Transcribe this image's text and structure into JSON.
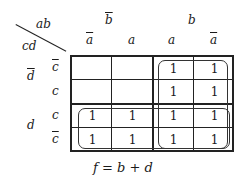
{
  "diagram": {
    "type": "karnaugh-map",
    "corner_labels": {
      "columns": "ab",
      "rows": "cd"
    },
    "column_groups": [
      {
        "var": "b",
        "negated": true
      },
      {
        "var": "b",
        "negated": false
      }
    ],
    "columns": [
      {
        "var": "a",
        "negated": true
      },
      {
        "var": "a",
        "negated": false
      },
      {
        "var": "a",
        "negated": false
      },
      {
        "var": "a",
        "negated": true
      }
    ],
    "row_groups": [
      {
        "var": "d",
        "negated": true
      },
      {
        "var": "d",
        "negated": false
      }
    ],
    "rows": [
      {
        "var": "c",
        "negated": true
      },
      {
        "var": "c",
        "negated": false
      },
      {
        "var": "c",
        "negated": false
      },
      {
        "var": "c",
        "negated": true
      }
    ],
    "cells": [
      [
        "",
        "",
        "1",
        "1"
      ],
      [
        "",
        "",
        "1",
        "1"
      ],
      [
        "1",
        "1",
        "1",
        "1"
      ],
      [
        "1",
        "1",
        "1",
        "1"
      ]
    ],
    "groupings": [
      {
        "name": "b",
        "rows": [
          0,
          3
        ],
        "cols": [
          2,
          3
        ]
      },
      {
        "name": "d",
        "rows": [
          2,
          3
        ],
        "cols": [
          0,
          3
        ]
      }
    ],
    "equation": "f = b + d"
  }
}
